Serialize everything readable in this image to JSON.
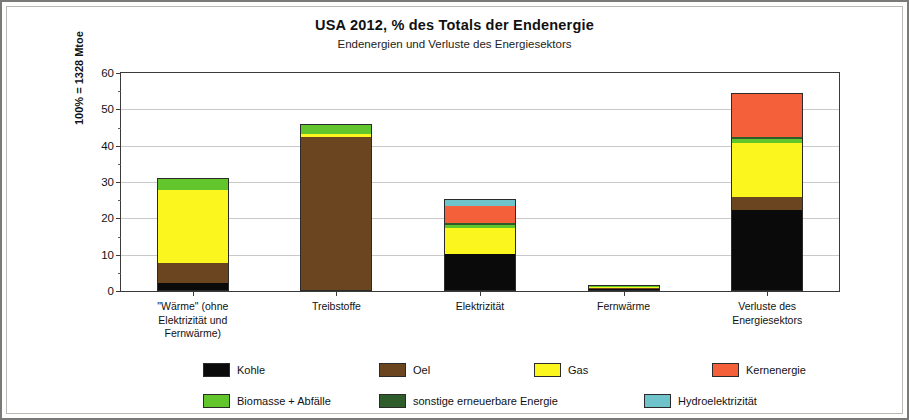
{
  "chart_data": {
    "type": "bar",
    "stacked": true,
    "title": "USA 2012,  % des Totals der Endenergie",
    "subtitle": "Endenergien und Verluste des Energiesektors",
    "ylabel": "100% = 1328 Mtoe",
    "xlabel": "",
    "ylim": [
      0,
      60
    ],
    "yticks": [
      0,
      10,
      20,
      30,
      40,
      50,
      60
    ],
    "ytick_labels": [
      "0",
      "10",
      "20",
      "30",
      "40",
      "50",
      "60"
    ],
    "minor_ticks": true,
    "grid": true,
    "legend_position": "bottom",
    "categories": [
      "\"Wärme\" (ohne\nElektrizität und\nFernwärme)",
      "Treibstoffe",
      "Elektrizität",
      "Fernwärme",
      "Verluste des\nEnergiesektors"
    ],
    "category_lines": [
      [
        "\"Wärme\" (ohne",
        "Elektrizität und",
        "Fernwärme)"
      ],
      [
        "Treibstoffe"
      ],
      [
        "Elektrizität"
      ],
      [
        "Fernwärme"
      ],
      [
        "Verluste des",
        "Energiesektors"
      ]
    ],
    "series": [
      {
        "name": "Kohle",
        "color": "#0a0a0a",
        "values": [
          2.0,
          0.0,
          10.0,
          0.3,
          22.0
        ]
      },
      {
        "name": "Oel",
        "color": "#6B4420",
        "values": [
          5.5,
          42.0,
          0.0,
          0.2,
          3.5
        ]
      },
      {
        "name": "Gas",
        "color": "#FAF61E",
        "values": [
          20.0,
          1.0,
          7.0,
          0.4,
          15.0
        ]
      },
      {
        "name": "Biomasse + Abfälle",
        "color": "#63C52C",
        "values": [
          3.0,
          2.3,
          0.8,
          0.1,
          1.0
        ]
      },
      {
        "name": "sonstige erneuerbare Energie",
        "color": "#2E5C2A",
        "values": [
          0.0,
          0.2,
          0.7,
          0.0,
          0.5
        ]
      },
      {
        "name": "Kernenergie",
        "color": "#F4603A",
        "values": [
          0.0,
          0.0,
          4.7,
          0.0,
          12.0
        ]
      },
      {
        "name": "Hydroelektrizität",
        "color": "#6FC3CB",
        "values": [
          0.0,
          0.0,
          1.6,
          0.0,
          0.0
        ]
      }
    ],
    "totals": [
      30.5,
      45.5,
      24.8,
      1.0,
      54.0
    ]
  },
  "legend": {
    "row1": [
      {
        "label": "Kohle",
        "color": "#0a0a0a"
      },
      {
        "label": "Oel",
        "color": "#6B4420"
      },
      {
        "label": "Gas",
        "color": "#FAF61E"
      },
      {
        "label": "Kernenergie",
        "color": "#F4603A"
      }
    ],
    "row2": [
      {
        "label": "Biomasse + Abfälle",
        "color": "#63C52C"
      },
      {
        "label": "sonstige erneuerbare Energie",
        "color": "#2E5C2A"
      },
      {
        "label": "Hydroelektrizität",
        "color": "#6FC3CB"
      }
    ]
  }
}
